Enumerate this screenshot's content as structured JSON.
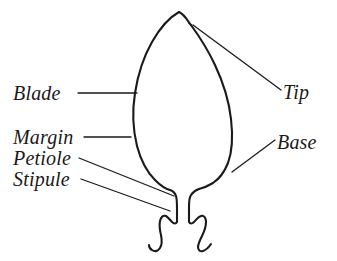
{
  "figure": {
    "style": "hand-drawn line illustration",
    "background_color": "#ffffff",
    "ink_color": "#1a1a1a"
  },
  "labels": {
    "blade": "Blade",
    "margin": "Margin",
    "petiole": "Petiole",
    "stipule": "Stipule",
    "tip": "Tip",
    "base": "Base"
  },
  "parts": [
    {
      "name": "blade",
      "label": "Blade",
      "side": "left",
      "leader": "horizontal"
    },
    {
      "name": "margin",
      "label": "Margin",
      "side": "left",
      "leader": "horizontal"
    },
    {
      "name": "petiole",
      "label": "Petiole",
      "side": "left",
      "leader": "diagonal"
    },
    {
      "name": "stipule",
      "label": "Stipule",
      "side": "left",
      "leader": "diagonal"
    },
    {
      "name": "tip",
      "label": "Tip",
      "side": "right",
      "leader": "diagonal"
    },
    {
      "name": "base",
      "label": "Base",
      "side": "right",
      "leader": "diagonal"
    }
  ]
}
